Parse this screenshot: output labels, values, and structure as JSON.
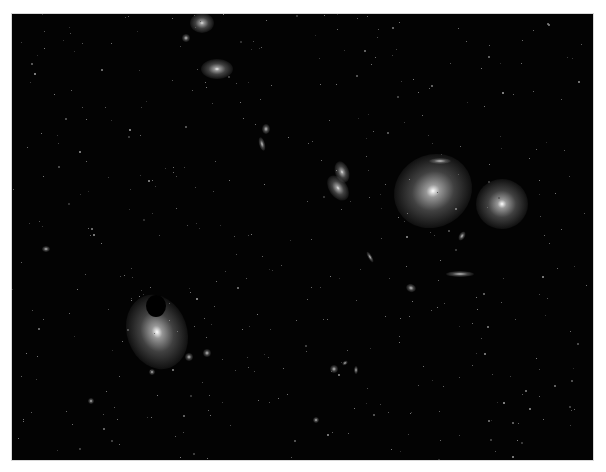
{
  "image": {
    "subject": "galaxy cluster deep-field",
    "background_color": "#030303",
    "border_color": "#d8d8d8",
    "frame": {
      "x": 12,
      "y": 14,
      "width": 581,
      "height": 446
    }
  },
  "galaxies": [
    {
      "name": "giant-elliptical-upper-right",
      "x": 433,
      "y": 191,
      "rx": 40,
      "ry": 36,
      "rot": -30,
      "core": "#ffffff"
    },
    {
      "name": "elliptical-right",
      "x": 502,
      "y": 204,
      "rx": 26,
      "ry": 25,
      "rot": 0,
      "core": "#ffffff"
    },
    {
      "name": "elliptical-lower-left",
      "x": 157,
      "y": 332,
      "rx": 30,
      "ry": 38,
      "rot": -20,
      "core": "#ffffff"
    },
    {
      "name": "elliptical-top",
      "x": 202,
      "y": 23,
      "rx": 12,
      "ry": 10,
      "rot": 0,
      "core": "#e0e0e0"
    },
    {
      "name": "elliptical-top-2",
      "x": 217,
      "y": 69,
      "rx": 16,
      "ry": 10,
      "rot": 0,
      "core": "#f0f0f0"
    },
    {
      "name": "small-top",
      "x": 186,
      "y": 38,
      "rx": 4,
      "ry": 4,
      "rot": 0,
      "core": "#c0c0c0"
    },
    {
      "name": "interacting-pair-a",
      "x": 342,
      "y": 172,
      "rx": 7,
      "ry": 11,
      "rot": -20,
      "core": "#e8e8e8"
    },
    {
      "name": "interacting-pair-b",
      "x": 338,
      "y": 188,
      "rx": 9,
      "ry": 14,
      "rot": -35,
      "core": "#e8e8e8"
    },
    {
      "name": "edge-on-top-right",
      "x": 440,
      "y": 161,
      "rx": 11,
      "ry": 3,
      "rot": 0,
      "core": "#d0d0d0"
    },
    {
      "name": "edge-on-lower-right",
      "x": 460,
      "y": 274,
      "rx": 14,
      "ry": 3,
      "rot": 0,
      "core": "#e0e0e0"
    },
    {
      "name": "small-spiral-1",
      "x": 266,
      "y": 129,
      "rx": 4,
      "ry": 5,
      "rot": 0,
      "core": "#d0d0d0"
    },
    {
      "name": "small-spiral-2",
      "x": 262,
      "y": 144,
      "rx": 3,
      "ry": 7,
      "rot": -15,
      "core": "#d0d0d0"
    },
    {
      "name": "small-edge-mid",
      "x": 370,
      "y": 257,
      "rx": 2,
      "ry": 6,
      "rot": -30,
      "core": "#c8c8c8"
    },
    {
      "name": "small-right-mid",
      "x": 462,
      "y": 236,
      "rx": 3,
      "ry": 5,
      "rot": 30,
      "core": "#c8c8c8"
    },
    {
      "name": "small-mid-lower",
      "x": 411,
      "y": 288,
      "rx": 5,
      "ry": 4,
      "rot": 20,
      "core": "#c8c8c8"
    },
    {
      "name": "companion-1",
      "x": 189,
      "y": 357,
      "rx": 4,
      "ry": 4,
      "rot": 0,
      "core": "#e0e0e0"
    },
    {
      "name": "companion-2",
      "x": 207,
      "y": 353,
      "rx": 4,
      "ry": 4,
      "rot": 0,
      "core": "#d0d0d0"
    },
    {
      "name": "companion-3",
      "x": 152,
      "y": 372,
      "rx": 3,
      "ry": 3,
      "rot": 0,
      "core": "#c0c0c0"
    },
    {
      "name": "small-left",
      "x": 46,
      "y": 249,
      "rx": 4,
      "ry": 3,
      "rot": 0,
      "core": "#a8a8a8"
    },
    {
      "name": "group-bottom-1",
      "x": 334,
      "y": 369,
      "rx": 4,
      "ry": 4,
      "rot": 0,
      "core": "#d0d0d0"
    },
    {
      "name": "group-bottom-2",
      "x": 345,
      "y": 363,
      "rx": 3,
      "ry": 2,
      "rot": -30,
      "core": "#c0c0c0"
    },
    {
      "name": "group-bottom-3",
      "x": 356,
      "y": 370,
      "rx": 2,
      "ry": 4,
      "rot": 0,
      "core": "#c0c0c0"
    },
    {
      "name": "small-bottom",
      "x": 316,
      "y": 420,
      "rx": 3,
      "ry": 3,
      "rot": 0,
      "core": "#b0b0b0"
    },
    {
      "name": "small-bottom-left",
      "x": 91,
      "y": 401,
      "rx": 3,
      "ry": 3,
      "rot": 0,
      "core": "#a0a0a0"
    }
  ],
  "occluder": {
    "name": "masked-star",
    "x": 156,
    "y": 306,
    "rx": 10,
    "ry": 11,
    "color": "#000000"
  }
}
